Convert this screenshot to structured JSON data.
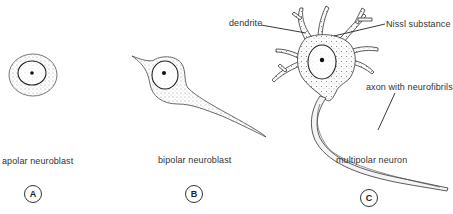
{
  "panels": [
    {
      "id": "A",
      "caption": "apolar neuroblast"
    },
    {
      "id": "B",
      "caption": "bipolar neuroblast"
    },
    {
      "id": "C",
      "caption": "multipolar neuron"
    }
  ],
  "annotations": {
    "dendrite": "dendrite",
    "nissl": "Nissl substance",
    "axon": "axon with neurofibrils"
  }
}
